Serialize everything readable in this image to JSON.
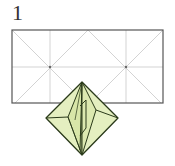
{
  "diagram": {
    "step_number": "1",
    "type": "origami-fold-step",
    "paper": {
      "shape": "rectangle",
      "aspect": "2:1",
      "crease_color": "#c8c8c8",
      "edge_color": "#555555"
    },
    "model": {
      "shape": "diamond (preliminary/waterbomb base form)",
      "fill_color": "#e4efc0",
      "line_color": "#2a3a1a"
    }
  }
}
